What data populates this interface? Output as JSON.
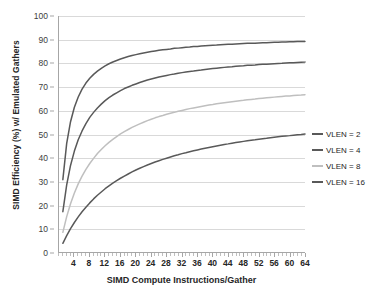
{
  "chart_data": {
    "type": "line",
    "title": "",
    "xlabel": "SIMD Compute Instructions/Gather",
    "ylabel": "SIMD Efficiency (%) w/ Emulated Gathers",
    "xlim": [
      0,
      64
    ],
    "ylim": [
      0,
      100
    ],
    "grid": true,
    "legend_position": "right",
    "x_ticks": [
      4,
      8,
      12,
      16,
      20,
      24,
      28,
      32,
      36,
      40,
      44,
      48,
      52,
      56,
      60,
      64
    ],
    "x_minor_tick_step": 1,
    "y_ticks": [
      0,
      10,
      20,
      30,
      40,
      50,
      60,
      70,
      80,
      90,
      100
    ],
    "x": [
      1,
      2,
      3,
      4,
      5,
      6,
      7,
      8,
      9,
      10,
      11,
      12,
      13,
      14,
      15,
      16,
      17,
      18,
      19,
      20,
      21,
      22,
      23,
      24,
      25,
      26,
      27,
      28,
      29,
      30,
      31,
      32,
      33,
      34,
      35,
      36,
      37,
      38,
      39,
      40,
      41,
      42,
      43,
      44,
      45,
      46,
      47,
      48,
      49,
      50,
      51,
      52,
      53,
      54,
      55,
      56,
      57,
      58,
      59,
      60,
      61,
      62,
      63,
      64
    ],
    "series": [
      {
        "name": "VLEN = 2",
        "color": "#595959",
        "values": [
          33.3,
          50.0,
          60.0,
          66.7,
          71.4,
          75.0,
          77.8,
          80.0,
          81.8,
          83.3,
          84.6,
          85.7,
          86.7,
          87.5,
          88.2,
          88.9,
          89.5,
          90.0,
          90.5,
          90.9,
          91.3,
          91.7,
          92.0,
          92.3,
          92.6,
          92.9,
          93.1,
          93.3,
          93.5,
          93.8,
          93.9,
          94.1,
          94.3,
          94.4,
          94.6,
          94.7,
          94.9,
          95.0,
          95.1,
          95.2,
          95.3,
          95.5,
          95.6,
          95.7,
          95.7,
          95.8,
          95.9,
          96.0,
          96.1,
          96.2,
          96.2,
          96.3,
          96.4,
          96.4,
          96.5,
          96.6,
          96.6,
          96.7,
          96.7,
          96.8,
          96.8,
          96.9,
          96.9,
          97.0
        ]
      },
      {
        "name": "VLEN = 4",
        "color": "#595959",
        "values": [
          20.0,
          33.3,
          42.9,
          50.0,
          55.6,
          60.0,
          63.6,
          66.7,
          69.2,
          71.4,
          73.3,
          75.0,
          76.5,
          77.8,
          78.9,
          80.0,
          81.0,
          81.8,
          82.6,
          83.3,
          84.0,
          84.6,
          85.2,
          85.7,
          86.2,
          86.7,
          87.1,
          87.5,
          87.9,
          88.2,
          88.6,
          88.9,
          89.2,
          89.5,
          89.7,
          90.0,
          90.2,
          90.5,
          90.7,
          90.9,
          91.1,
          91.3,
          91.5,
          91.7,
          91.8,
          92.0,
          92.2,
          92.3,
          92.5,
          92.6,
          92.7,
          92.9,
          93.0,
          93.1,
          93.2,
          93.3,
          93.4,
          93.5,
          93.7,
          93.8,
          93.8,
          93.9,
          94.0,
          94.1
        ]
      },
      {
        "name": "VLEN = 8",
        "color": "#bfbfbf",
        "values": [
          11.1,
          20.0,
          27.3,
          33.3,
          38.5,
          42.9,
          46.7,
          50.0,
          52.9,
          55.6,
          57.9,
          60.0,
          61.9,
          63.6,
          65.2,
          66.7,
          68.0,
          69.2,
          70.4,
          71.4,
          72.4,
          73.3,
          74.2,
          75.0,
          75.8,
          76.5,
          77.1,
          77.8,
          78.4,
          78.9,
          79.5,
          80.0,
          80.5,
          81.0,
          81.4,
          81.8,
          82.2,
          82.6,
          83.0,
          83.3,
          83.7,
          84.0,
          84.3,
          84.6,
          84.9,
          85.2,
          85.5,
          85.7,
          86.0,
          86.2,
          86.4,
          86.7,
          86.9,
          87.1,
          87.3,
          87.5,
          87.7,
          87.9,
          88.1,
          88.2,
          88.4,
          88.6,
          88.7,
          88.9
        ]
      },
      {
        "name": "VLEN = 16",
        "color": "#595959",
        "values": [
          5.9,
          11.1,
          15.8,
          20.0,
          23.8,
          27.3,
          30.4,
          33.3,
          36.0,
          38.5,
          40.7,
          42.9,
          44.8,
          46.7,
          48.4,
          50.0,
          51.5,
          52.9,
          54.3,
          55.6,
          56.8,
          57.9,
          59.0,
          60.0,
          61.0,
          61.9,
          62.8,
          63.6,
          64.4,
          65.2,
          65.9,
          66.7,
          67.3,
          68.0,
          68.6,
          69.2,
          69.8,
          70.4,
          70.9,
          71.4,
          71.9,
          72.4,
          72.9,
          73.3,
          73.8,
          74.2,
          74.6,
          75.0,
          75.4,
          75.8,
          76.1,
          76.5,
          76.8,
          77.1,
          77.5,
          77.8,
          78.1,
          78.4,
          78.7,
          78.9,
          79.2,
          79.5,
          79.7,
          80.0
        ]
      }
    ],
    "display_scale": {
      "VLEN = 2": 0.92,
      "VLEN = 4": 0.855,
      "VLEN = 8": 0.75,
      "VLEN = 16": 0.625
    }
  },
  "legend": {
    "items": [
      {
        "label": "VLEN = 2",
        "color": "#595959"
      },
      {
        "label": "VLEN = 4",
        "color": "#595959"
      },
      {
        "label": "VLEN = 8",
        "color": "#bfbfbf"
      },
      {
        "label": "VLEN = 16",
        "color": "#595959"
      }
    ]
  },
  "colors": {
    "gridline": "#d9d9d9",
    "axis": "#a6a6a6",
    "text": "#262626",
    "tick_text": "#404040",
    "background": "#ffffff"
  }
}
